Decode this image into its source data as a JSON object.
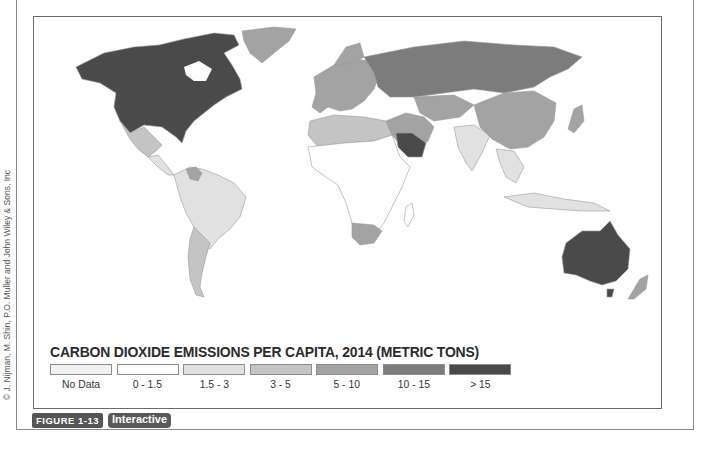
{
  "figure": {
    "label": "FIGURE 1-13",
    "interactive_label": "Interactive",
    "credit": "© J. Nijman, M. Shin, P.O. Muller and John Wiley & Sons, Inc"
  },
  "map": {
    "title": "CARBON DIOXIDE EMISSIONS PER CAPITA, 2014 (METRIC TONS)",
    "type": "choropleth world map",
    "legend": [
      {
        "label": "No Data",
        "color": "#f2f2f2"
      },
      {
        "label": "0 - 1.5",
        "color": "#ffffff"
      },
      {
        "label": "1.5 - 3",
        "color": "#e1e1e1"
      },
      {
        "label": "3 - 5",
        "color": "#c4c4c4"
      },
      {
        "label": "5 - 10",
        "color": "#a3a3a3"
      },
      {
        "label": "10 - 15",
        "color": "#7c7c7c"
      },
      {
        "label": "> 15",
        "color": "#4a4a4a"
      }
    ],
    "regions": [
      {
        "name": "North America (USA, Canada)",
        "class": "> 15"
      },
      {
        "name": "Greenland",
        "class": "5 - 10"
      },
      {
        "name": "Mexico",
        "class": "3 - 5"
      },
      {
        "name": "Central America / Caribbean",
        "class": "1.5 - 3"
      },
      {
        "name": "Venezuela",
        "class": "5 - 10"
      },
      {
        "name": "Brazil",
        "class": "1.5 - 3"
      },
      {
        "name": "Argentina / Chile",
        "class": "3 - 5"
      },
      {
        "name": "Western Europe",
        "class": "5 - 10"
      },
      {
        "name": "Russia",
        "class": "10 - 15"
      },
      {
        "name": "China",
        "class": "5 - 10"
      },
      {
        "name": "Saudi Arabia / Gulf",
        "class": "> 15"
      },
      {
        "name": "Iran",
        "class": "5 - 10"
      },
      {
        "name": "India",
        "class": "1.5 - 3"
      },
      {
        "name": "Sub-Saharan Africa",
        "class": "0 - 1.5"
      },
      {
        "name": "South Africa",
        "class": "5 - 10"
      },
      {
        "name": "Australia",
        "class": "> 15"
      },
      {
        "name": "New Zealand",
        "class": "5 - 10"
      },
      {
        "name": "Japan",
        "class": "5 - 10"
      },
      {
        "name": "Southeast Asia",
        "class": "1.5 - 3"
      }
    ]
  }
}
